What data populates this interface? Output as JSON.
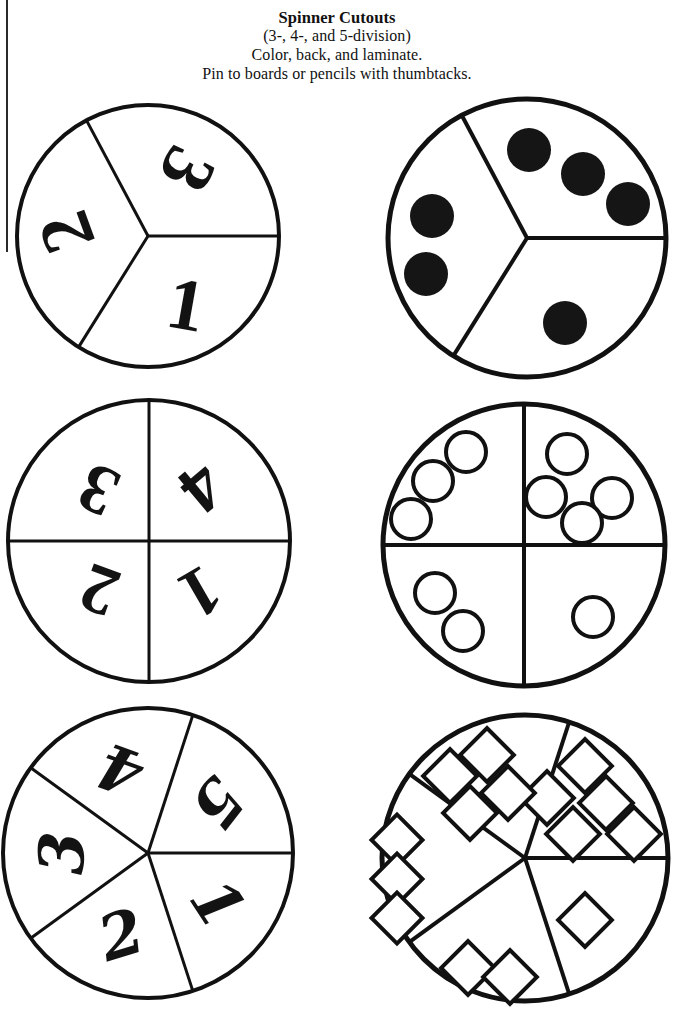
{
  "header": {
    "title": "Spinner Cutouts",
    "line2": "(3-, 4-, and 5-division)",
    "line3": "Color, back, and laminate.",
    "line4": "Pin to boards or pencils with thumbtacks."
  },
  "colors": {
    "ink": "#111111",
    "paper": "#ffffff",
    "pip_fill": "#151515"
  },
  "spinners": [
    {
      "id": "spinner-3-numerals",
      "divisions": 3,
      "marking": "numerals",
      "style": "ornate-outline",
      "cx": 148,
      "cy": 236,
      "r": 131,
      "stroke_width": 4,
      "spoke_width": 3,
      "spoke_angles_deg": [
        0,
        118,
        238
      ],
      "sectors": [
        {
          "label": "3",
          "value": 3,
          "label_angle_deg": 59,
          "label_radius": 78,
          "rotate_deg": 118
        },
        {
          "label": "2",
          "value": 2,
          "label_angle_deg": 178,
          "label_radius": 82,
          "rotate_deg": 250
        },
        {
          "label": "1",
          "value": 1,
          "label_angle_deg": 299,
          "label_radius": 78,
          "rotate_deg": 10
        }
      ]
    },
    {
      "id": "spinner-3-dots",
      "divisions": 3,
      "marking": "filled-dots",
      "style": "solid-circle",
      "cx": 527,
      "cy": 238,
      "r": 139,
      "stroke_width": 5,
      "spoke_width": 4,
      "spoke_angles_deg": [
        0,
        118,
        238
      ],
      "sectors": [
        {
          "value": 3,
          "pips": [
            {
              "x": 2,
              "y": -88,
              "r": 22
            },
            {
              "x": 56,
              "y": -64,
              "r": 22
            },
            {
              "x": 101,
              "y": -34,
              "r": 22
            }
          ]
        },
        {
          "value": 2,
          "pips": [
            {
              "x": -95,
              "y": -22,
              "r": 22
            },
            {
              "x": -101,
              "y": 36,
              "r": 22
            }
          ]
        },
        {
          "value": 1,
          "pips": [
            {
              "x": 38,
              "y": 85,
              "r": 22
            }
          ]
        }
      ]
    },
    {
      "id": "spinner-4-numerals",
      "divisions": 4,
      "marking": "numerals",
      "style": "striped",
      "cx": 149,
      "cy": 541,
      "r": 141,
      "stroke_width": 4,
      "spoke_width": 3,
      "spoke_angles_deg": [
        0,
        90,
        180,
        270
      ],
      "sectors": [
        {
          "label": "3",
          "value": 3,
          "label_angle_deg": 135,
          "label_radius": 72,
          "rotate_deg": 205
        },
        {
          "label": "4",
          "value": 4,
          "label_angle_deg": 45,
          "label_radius": 75,
          "rotate_deg": 140
        },
        {
          "label": "2",
          "value": 2,
          "label_angle_deg": 225,
          "label_radius": 70,
          "rotate_deg": 200
        },
        {
          "label": "1",
          "value": 1,
          "label_angle_deg": 315,
          "label_radius": 73,
          "rotate_deg": 150
        }
      ]
    },
    {
      "id": "spinner-4-circles",
      "divisions": 4,
      "marking": "open-circles",
      "style": "outline-circle",
      "cx": 524,
      "cy": 545,
      "r": 141,
      "stroke_width": 5,
      "spoke_width": 4,
      "spoke_angles_deg": [
        0,
        90,
        180,
        270
      ],
      "sectors": [
        {
          "value": 3,
          "pips": [
            {
              "x": -58,
              "y": -93,
              "r": 20
            },
            {
              "x": -91,
              "y": -64,
              "r": 20
            },
            {
              "x": -113,
              "y": -26,
              "r": 20
            }
          ]
        },
        {
          "value": 4,
          "pips": [
            {
              "x": 43,
              "y": -91,
              "r": 20
            },
            {
              "x": 22,
              "y": -48,
              "r": 20
            },
            {
              "x": 88,
              "y": -47,
              "r": 20
            },
            {
              "x": 58,
              "y": -22,
              "r": 20
            }
          ]
        },
        {
          "value": 2,
          "pips": [
            {
              "x": -89,
              "y": 48,
              "r": 20
            },
            {
              "x": -61,
              "y": 86,
              "r": 20
            }
          ]
        },
        {
          "value": 1,
          "pips": [
            {
              "x": 69,
              "y": 72,
              "r": 20
            }
          ]
        }
      ]
    },
    {
      "id": "spinner-5-numerals",
      "divisions": 5,
      "marking": "numerals",
      "style": "script",
      "cx": 148,
      "cy": 853,
      "r": 145,
      "stroke_width": 4,
      "spoke_width": 3,
      "spoke_angles_deg": [
        0,
        72,
        144,
        216,
        288
      ],
      "sectors": [
        {
          "label": "5",
          "value": 5,
          "label_angle_deg": 36,
          "label_radius": 86,
          "rotate_deg": 128
        },
        {
          "label": "4",
          "value": 4,
          "label_angle_deg": 108,
          "label_radius": 88,
          "rotate_deg": 200
        },
        {
          "label": "3",
          "value": 3,
          "label_angle_deg": 180,
          "label_radius": 86,
          "rotate_deg": 272
        },
        {
          "label": "2",
          "value": 2,
          "label_angle_deg": 252,
          "label_radius": 86,
          "rotate_deg": 343
        },
        {
          "label": "1",
          "value": 1,
          "label_angle_deg": 324,
          "label_radius": 86,
          "rotate_deg": 57
        }
      ]
    },
    {
      "id": "spinner-5-diamonds",
      "divisions": 5,
      "marking": "open-diamonds",
      "style": "outline-diamond",
      "cx": 525,
      "cy": 858,
      "r": 143,
      "stroke_width": 5,
      "spoke_width": 4,
      "spoke_angles_deg": [
        0,
        72,
        144,
        216,
        288
      ],
      "sectors": [
        {
          "value": 5,
          "pips": [
            {
              "x": 60,
              "y": -92,
              "r": 19
            },
            {
              "x": 22,
              "y": -60,
              "r": 19
            },
            {
              "x": 81,
              "y": -55,
              "r": 19
            },
            {
              "x": 48,
              "y": -24,
              "r": 19
            },
            {
              "x": 109,
              "y": -24,
              "r": 19
            }
          ]
        },
        {
          "value": 4,
          "pips": [
            {
              "x": -38,
              "y": -103,
              "r": 19
            },
            {
              "x": -75,
              "y": -82,
              "r": 19
            },
            {
              "x": -17,
              "y": -65,
              "r": 19
            },
            {
              "x": -55,
              "y": -45,
              "r": 19
            }
          ]
        },
        {
          "value": 3,
          "pips": [
            {
              "x": -128,
              "y": -18,
              "r": 18
            },
            {
              "x": -128,
              "y": 21,
              "r": 18
            },
            {
              "x": -128,
              "y": 60,
              "r": 18
            }
          ]
        },
        {
          "value": 2,
          "pips": [
            {
              "x": -57,
              "y": 110,
              "r": 19
            },
            {
              "x": -15,
              "y": 119,
              "r": 19
            }
          ]
        },
        {
          "value": 1,
          "pips": [
            {
              "x": 60,
              "y": 62,
              "r": 19
            }
          ]
        }
      ]
    }
  ]
}
